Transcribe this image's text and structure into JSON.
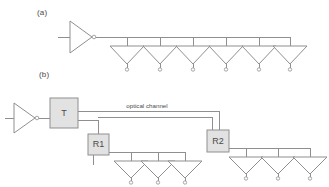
{
  "figure": {
    "width": 329,
    "height": 187,
    "background": "#ffffff",
    "line_color": "#8f8f8f",
    "box_fill": "#e2e2e2",
    "text_color": "#4a4a4a"
  },
  "panels": [
    {
      "id": "a",
      "label": "(a)",
      "description": "Electrical bus distribution: one amplifier feeding six tapped receivers",
      "source": {
        "type": "amplifier",
        "orientation": "right",
        "output_marker": "circle",
        "x": 70,
        "y": 35
      },
      "bus": {
        "y": 37,
        "x_start": 93,
        "x_end": 290
      },
      "taps": [
        {
          "index": 1,
          "label": "",
          "cx": 127,
          "drop_x": 127
        },
        {
          "index": 2,
          "label": "",
          "cx": 160,
          "drop_x": 160
        },
        {
          "index": 3,
          "label": "",
          "cx": 193,
          "drop_x": 193
        },
        {
          "index": 4,
          "label": "",
          "cx": 226,
          "drop_x": 226
        },
        {
          "index": 5,
          "label": "",
          "cx": 259,
          "drop_x": 259
        },
        {
          "index": 6,
          "label": "",
          "cx": 290,
          "drop_x": 290
        }
      ],
      "tap_count": 6
    },
    {
      "id": "b",
      "label": "(b)",
      "description": "Optical distribution: amplifier to transmitter T, optical channel to receivers R1 and R2, each feeding three tapped receivers",
      "source": {
        "type": "amplifier",
        "orientation": "right",
        "output_marker": "circle",
        "x": 12,
        "y": 118
      },
      "transmitter": {
        "label": "T",
        "x": 50,
        "y": 98,
        "width": 28,
        "height": 30
      },
      "channel_label": "optical channel",
      "channel_label_x": 147,
      "channel_label_y": 110,
      "receivers": [
        {
          "label": "R1",
          "x": 88,
          "y": 134,
          "width": 21,
          "height": 21,
          "bus_y": 152,
          "bus_x_start": 109,
          "bus_x_end": 185,
          "taps": [
            {
              "index": 1,
              "cx": 131
            },
            {
              "index": 2,
              "cx": 158
            },
            {
              "index": 3,
              "cx": 185
            }
          ],
          "tap_count": 3
        },
        {
          "label": "R2",
          "x": 207,
          "y": 130,
          "width": 22,
          "height": 22,
          "bus_y": 148,
          "bus_x_start": 229,
          "bus_x_end": 310,
          "taps": [
            {
              "index": 1,
              "cx": 246
            },
            {
              "index": 2,
              "cx": 278
            },
            {
              "index": 3,
              "cx": 310
            }
          ],
          "tap_count": 3
        }
      ]
    }
  ]
}
